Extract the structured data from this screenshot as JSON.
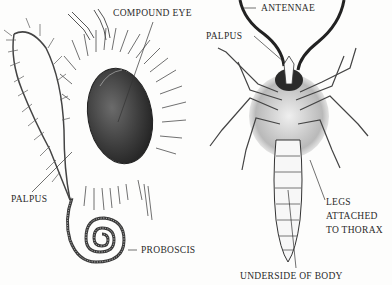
{
  "diagram": {
    "panels": [
      {
        "name": "head-side-view"
      },
      {
        "name": "underside-of-body"
      }
    ],
    "labels": {
      "compound_eye": "COMPOUND EYE",
      "palpus_left": "PALPUS",
      "proboscis": "PROBOSCIS",
      "antennae": "ANTENNAE",
      "palpus_right": "PALPUS",
      "legs_line1": "LEGS",
      "legs_line2": "ATTACHED",
      "legs_line3": "TO THORAX",
      "underside": "UNDERSIDE OF BODY"
    },
    "colors": {
      "ink": "#2a2a2a",
      "background": "#fdfdfc",
      "eye": "#3a3a3a"
    }
  }
}
